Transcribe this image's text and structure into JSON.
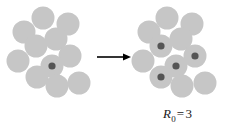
{
  "figure": {
    "width": 227,
    "height": 136,
    "background": "#ffffff"
  },
  "colors": {
    "susceptible_fill": "#c6c6c6",
    "infected_fill": "#555555",
    "arrow": "#000000",
    "label_text": "#1a1a1a"
  },
  "panels": {
    "left": {
      "name": "before-transmission",
      "circle_radius": 11.5,
      "infected_dot_radius": 3.6,
      "circles": [
        {
          "cx": 24,
          "cy": 32,
          "state": "susceptible"
        },
        {
          "cx": 43,
          "cy": 18,
          "state": "susceptible"
        },
        {
          "cx": 68,
          "cy": 24,
          "state": "susceptible"
        },
        {
          "cx": 56,
          "cy": 39,
          "state": "susceptible"
        },
        {
          "cx": 36,
          "cy": 46,
          "state": "susceptible"
        },
        {
          "cx": 18,
          "cy": 61,
          "state": "susceptible"
        },
        {
          "cx": 70,
          "cy": 56,
          "state": "susceptible"
        },
        {
          "cx": 52,
          "cy": 66,
          "state": "infected"
        },
        {
          "cx": 37,
          "cy": 77,
          "state": "susceptible"
        },
        {
          "cx": 57,
          "cy": 86,
          "state": "susceptible"
        },
        {
          "cx": 79,
          "cy": 83,
          "state": "susceptible"
        }
      ]
    },
    "right": {
      "name": "after-transmission",
      "circle_radius": 11.5,
      "infected_dot_radius": 3.6,
      "circles": [
        {
          "cx": 149,
          "cy": 32,
          "state": "susceptible"
        },
        {
          "cx": 167,
          "cy": 18,
          "state": "susceptible"
        },
        {
          "cx": 192,
          "cy": 24,
          "state": "susceptible"
        },
        {
          "cx": 181,
          "cy": 39,
          "state": "susceptible"
        },
        {
          "cx": 161,
          "cy": 46,
          "state": "infected"
        },
        {
          "cx": 143,
          "cy": 61,
          "state": "susceptible"
        },
        {
          "cx": 195,
          "cy": 56,
          "state": "infected"
        },
        {
          "cx": 176,
          "cy": 66,
          "state": "infected"
        },
        {
          "cx": 161,
          "cy": 77,
          "state": "infected"
        },
        {
          "cx": 182,
          "cy": 86,
          "state": "susceptible"
        },
        {
          "cx": 205,
          "cy": 83,
          "state": "susceptible"
        }
      ]
    }
  },
  "arrow": {
    "name": "transition-arrow",
    "x1": 97,
    "y1": 57,
    "x2": 131,
    "y2": 57,
    "head_length": 8,
    "head_width": 7,
    "line_width": 1.6
  },
  "label": {
    "symbol": "R",
    "subscript": "0",
    "equals": "=",
    "value": "3",
    "full_text": "R0 = 3",
    "x": 163,
    "y": 106
  }
}
